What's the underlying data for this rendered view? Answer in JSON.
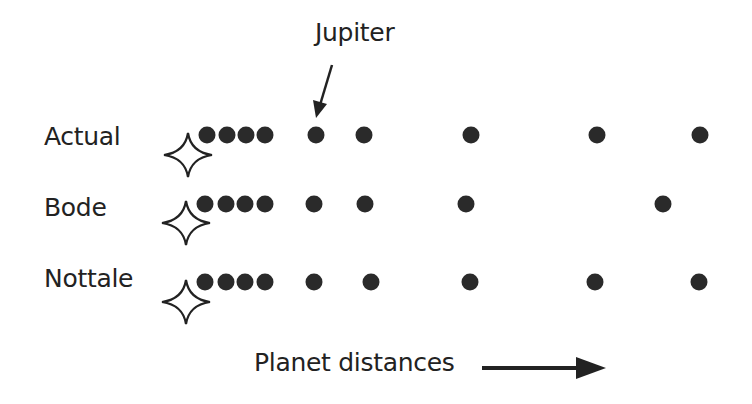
{
  "diagram": {
    "annotation": {
      "text": "Jupiter",
      "icon": "arrow-down-left-icon"
    },
    "axis_label": {
      "text": "Planet distances",
      "icon": "arrow-right-icon"
    },
    "rows": [
      {
        "label": "Actual",
        "y": 135,
        "star": {
          "x": 188,
          "y": 155
        },
        "dots_x": [
          207,
          227,
          246,
          265,
          316,
          364,
          471,
          597,
          700
        ]
      },
      {
        "label": "Bode",
        "y": 204,
        "star": {
          "x": 186,
          "y": 223
        },
        "dots_x": [
          205,
          226,
          245,
          265,
          314,
          365,
          466,
          663
        ]
      },
      {
        "label": "Nottale",
        "y": 282,
        "star": {
          "x": 186,
          "y": 302
        },
        "dots_x": [
          205,
          226,
          245,
          265,
          314,
          371,
          470,
          595,
          699
        ]
      }
    ],
    "colors": {
      "dot": "#2a2a2a",
      "text": "#222222",
      "background": "#ffffff"
    }
  }
}
